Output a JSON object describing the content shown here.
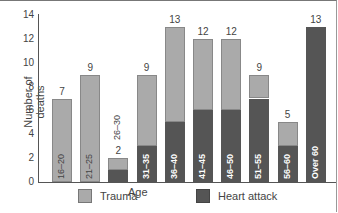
{
  "chart_data": {
    "type": "bar",
    "stacked": true,
    "title": "",
    "xlabel": "Age",
    "ylabel": "Number of deaths",
    "ylim": [
      0,
      14
    ],
    "yticks": [
      0,
      2,
      4,
      6,
      8,
      10,
      12,
      14
    ],
    "categories": [
      "16–20",
      "21–25",
      "26–30",
      "31–35",
      "36–40",
      "41–45",
      "46–50",
      "51–55",
      "56–60",
      "Over 60"
    ],
    "totals": [
      7,
      9,
      2,
      9,
      13,
      12,
      12,
      9,
      5,
      13
    ],
    "series": [
      {
        "name": "Heart attack",
        "color": "#555555",
        "values": [
          0,
          0,
          1,
          3,
          5,
          6,
          6,
          7,
          3,
          13
        ]
      },
      {
        "name": "Trauma",
        "color": "#aaaaaa",
        "values": [
          7,
          9,
          1,
          6,
          8,
          6,
          6,
          2,
          2,
          0
        ]
      }
    ],
    "legend": [
      {
        "label": "Trauma",
        "color": "#aaaaaa"
      },
      {
        "label": "Heart attack",
        "color": "#555555"
      }
    ],
    "legend_position": "bottom",
    "grid": false
  }
}
